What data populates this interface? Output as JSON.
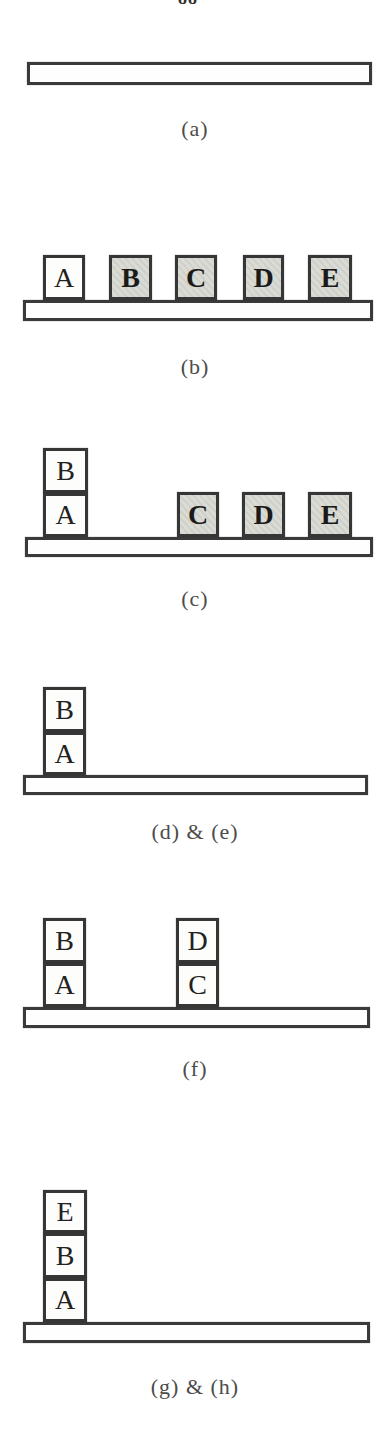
{
  "page": {
    "number": "88"
  },
  "palette": {
    "paper": "#ffffff",
    "line": "#3a3a3a",
    "block_white": "#fdfdfc",
    "block_shaded": "#d9d9d3",
    "letter": "#222220",
    "caption": "#4c4c4a"
  },
  "figure": {
    "sections": [
      {
        "id": "a",
        "caption": "(a)",
        "caption_top": 116,
        "table": {
          "x": 27,
          "y": 62,
          "w": 345,
          "h": 23
        },
        "blocks": []
      },
      {
        "id": "b",
        "caption": "(b)",
        "caption_top": 354,
        "table": {
          "x": 23,
          "y": 300,
          "w": 350,
          "h": 21
        },
        "blocks": [
          {
            "label": "A",
            "x": 43,
            "y": 255,
            "w": 42,
            "h": 45,
            "shaded": false
          },
          {
            "label": "B",
            "x": 109,
            "y": 255,
            "w": 43,
            "h": 45,
            "shaded": true
          },
          {
            "label": "C",
            "x": 175,
            "y": 255,
            "w": 42,
            "h": 45,
            "shaded": true
          },
          {
            "label": "D",
            "x": 243,
            "y": 255,
            "w": 41,
            "h": 45,
            "shaded": true
          },
          {
            "label": "E",
            "x": 308,
            "y": 255,
            "w": 44,
            "h": 45,
            "shaded": true
          }
        ]
      },
      {
        "id": "c",
        "caption": "(c)",
        "caption_top": 586,
        "table": {
          "x": 25,
          "y": 537,
          "w": 348,
          "h": 20
        },
        "blocks": [
          {
            "label": "B",
            "x": 43,
            "y": 448,
            "w": 45,
            "h": 45,
            "shaded": false
          },
          {
            "label": "A",
            "x": 43,
            "y": 493,
            "w": 45,
            "h": 44,
            "shaded": false
          },
          {
            "label": "C",
            "x": 177,
            "y": 492,
            "w": 42,
            "h": 45,
            "shaded": true
          },
          {
            "label": "D",
            "x": 242,
            "y": 492,
            "w": 43,
            "h": 45,
            "shaded": true
          },
          {
            "label": "E",
            "x": 308,
            "y": 492,
            "w": 44,
            "h": 45,
            "shaded": true
          }
        ]
      },
      {
        "id": "d-e",
        "caption": "(d) & (e)",
        "caption_top": 819,
        "table": {
          "x": 23,
          "y": 775,
          "w": 345,
          "h": 20
        },
        "blocks": [
          {
            "label": "B",
            "x": 43,
            "y": 687,
            "w": 43,
            "h": 45,
            "shaded": false
          },
          {
            "label": "A",
            "x": 43,
            "y": 732,
            "w": 43,
            "h": 43,
            "shaded": false
          }
        ]
      },
      {
        "id": "f",
        "caption": "(f)",
        "caption_top": 1056,
        "table": {
          "x": 23,
          "y": 1007,
          "w": 347,
          "h": 21
        },
        "blocks": [
          {
            "label": "B",
            "x": 43,
            "y": 918,
            "w": 43,
            "h": 45,
            "shaded": false
          },
          {
            "label": "A",
            "x": 43,
            "y": 963,
            "w": 43,
            "h": 44,
            "shaded": false
          },
          {
            "label": "D",
            "x": 176,
            "y": 918,
            "w": 43,
            "h": 45,
            "shaded": false
          },
          {
            "label": "C",
            "x": 176,
            "y": 963,
            "w": 43,
            "h": 44,
            "shaded": false
          }
        ]
      },
      {
        "id": "g-h",
        "caption": "(g) & (h)",
        "caption_top": 1374,
        "table": {
          "x": 23,
          "y": 1322,
          "w": 347,
          "h": 21
        },
        "blocks": [
          {
            "label": "E",
            "x": 43,
            "y": 1190,
            "w": 44,
            "h": 43,
            "shaded": false
          },
          {
            "label": "B",
            "x": 43,
            "y": 1233,
            "w": 44,
            "h": 45,
            "shaded": false
          },
          {
            "label": "A",
            "x": 43,
            "y": 1278,
            "w": 44,
            "h": 44,
            "shaded": false
          }
        ]
      }
    ]
  }
}
